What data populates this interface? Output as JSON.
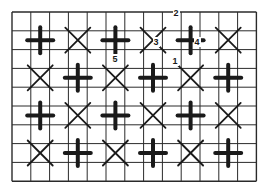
{
  "grid": {
    "left": 12,
    "top": 12,
    "cols": 13,
    "rows": 9,
    "cell": 18.8,
    "line_color": "#2a2a2a",
    "stroke_color": "#1a1a1a"
  },
  "symbols": [
    {
      "row": 1,
      "col": 1,
      "type": "plus"
    },
    {
      "row": 1,
      "col": 3,
      "type": "x"
    },
    {
      "row": 1,
      "col": 5,
      "type": "plus"
    },
    {
      "row": 1,
      "col": 7,
      "type": "x"
    },
    {
      "row": 1,
      "col": 9,
      "type": "plus"
    },
    {
      "row": 1,
      "col": 11,
      "type": "x"
    },
    {
      "row": 3,
      "col": 1,
      "type": "x"
    },
    {
      "row": 3,
      "col": 3,
      "type": "plus"
    },
    {
      "row": 3,
      "col": 5,
      "type": "x"
    },
    {
      "row": 3,
      "col": 7,
      "type": "plus"
    },
    {
      "row": 3,
      "col": 9,
      "type": "x"
    },
    {
      "row": 3,
      "col": 11,
      "type": "plus"
    },
    {
      "row": 5,
      "col": 1,
      "type": "plus"
    },
    {
      "row": 5,
      "col": 3,
      "type": "x"
    },
    {
      "row": 5,
      "col": 5,
      "type": "plus"
    },
    {
      "row": 5,
      "col": 7,
      "type": "x"
    },
    {
      "row": 5,
      "col": 9,
      "type": "plus"
    },
    {
      "row": 5,
      "col": 11,
      "type": "x"
    },
    {
      "row": 7,
      "col": 1,
      "type": "x"
    },
    {
      "row": 7,
      "col": 3,
      "type": "plus"
    },
    {
      "row": 7,
      "col": 5,
      "type": "x"
    },
    {
      "row": 7,
      "col": 7,
      "type": "plus"
    },
    {
      "row": 7,
      "col": 9,
      "type": "x"
    },
    {
      "row": 7,
      "col": 11,
      "type": "plus"
    }
  ],
  "labels": [
    {
      "text": "2",
      "x": 176,
      "y": 16
    },
    {
      "text": "3",
      "x": 156,
      "y": 45
    },
    {
      "text": "4",
      "x": 197,
      "y": 45
    },
    {
      "text": "1",
      "x": 175,
      "y": 64
    },
    {
      "text": "5",
      "x": 115,
      "y": 62
    }
  ]
}
